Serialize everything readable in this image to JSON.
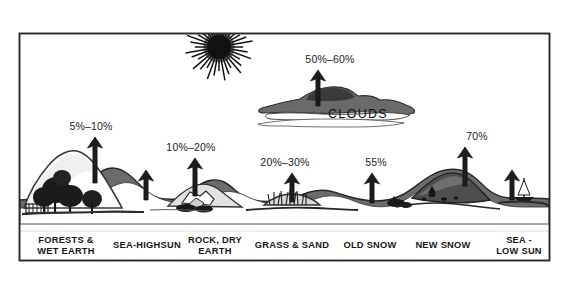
{
  "figure": {
    "type": "diagram",
    "frame": {
      "x": 19,
      "y": 33,
      "width": 531,
      "height": 228,
      "border_color": "#2a2a2a",
      "background": "#ffffff"
    },
    "ink_color": "#1f1f1f",
    "mid_gray": "#6e6e6e",
    "light_gray": "#b9b9b9"
  },
  "sun": {
    "name": "sun",
    "cx": 219,
    "cy": 47,
    "core_radius": 12,
    "ray_length": 22,
    "ray_count": 36,
    "color": "#131313"
  },
  "clouds": {
    "label": "CLOUDS",
    "label_x": 358,
    "label_y": 118,
    "percent": "50%–60%",
    "percent_x": 330,
    "percent_y": 63,
    "arrow_x": 318,
    "arrow_top": 70,
    "arrow_bottom": 106,
    "band_y": 98
  },
  "chart_data": {
    "type": "bar",
    "xlabel": "",
    "ylabel": "Percent of sunlight reflected",
    "grid": false,
    "legend": false,
    "categories": [
      "FORESTS & WET EARTH",
      "SEA-HIGHSUN",
      "ROCK, DRY EARTH",
      "GRASS & SAND",
      "OLD SNOW",
      "NEW SNOW",
      "SEA - LOW SUN",
      "CLOUDS"
    ],
    "value_labels": [
      "5%–10%",
      "",
      "10%–20%",
      "20%–30%",
      "55%",
      "70%",
      "",
      "50%–60%"
    ],
    "values": [
      7.5,
      null,
      15,
      25,
      55,
      70,
      null,
      55
    ],
    "value_ranges": [
      [
        5,
        10
      ],
      null,
      [
        10,
        20
      ],
      [
        20,
        30
      ],
      [
        55,
        55
      ],
      [
        70,
        70
      ],
      null,
      [
        50,
        60
      ]
    ],
    "units": "percent"
  },
  "surfaces": [
    {
      "id": "forests-wet-earth",
      "label_line1": "FORESTS &",
      "label_line2": "WET EARTH",
      "percent": "5%–10%",
      "percent_x": 91,
      "percent_y": 130,
      "arrow_x": 95,
      "arrow_top": 137,
      "arrow_bottom": 183,
      "label_x": 66,
      "label_y1": 243,
      "label_y2": 254
    },
    {
      "id": "sea-highsun",
      "label_line1": "SEA-HIGHSUN",
      "label_line2": "",
      "percent": "",
      "percent_x": 0,
      "percent_y": 0,
      "arrow_x": 146,
      "arrow_top": 170,
      "arrow_bottom": 200,
      "label_x": 147,
      "label_y1": 248,
      "label_y2": 0
    },
    {
      "id": "rock-dry-earth",
      "label_line1": "ROCK, DRY",
      "label_line2": "EARTH",
      "percent": "10%–20%",
      "percent_x": 191,
      "percent_y": 151,
      "arrow_x": 195,
      "arrow_top": 158,
      "arrow_bottom": 196,
      "label_x": 215,
      "label_y1": 243,
      "label_y2": 254
    },
    {
      "id": "grass-sand",
      "label_line1": "GRASS & SAND",
      "label_line2": "",
      "percent": "20%–30%",
      "percent_x": 285,
      "percent_y": 166,
      "arrow_x": 292,
      "arrow_top": 173,
      "arrow_bottom": 202,
      "label_x": 292,
      "label_y1": 248,
      "label_y2": 0
    },
    {
      "id": "old-snow",
      "label_line1": "OLD SNOW",
      "label_line2": "",
      "percent": "55%",
      "percent_x": 376,
      "percent_y": 166,
      "arrow_x": 372,
      "arrow_top": 173,
      "arrow_bottom": 203,
      "label_x": 370,
      "label_y1": 248,
      "label_y2": 0
    },
    {
      "id": "new-snow",
      "label_line1": "NEW SNOW",
      "label_line2": "",
      "percent": "70%",
      "percent_x": 477,
      "percent_y": 140,
      "arrow_x": 465,
      "arrow_top": 147,
      "arrow_bottom": 186,
      "label_x": 443,
      "label_y1": 248,
      "label_y2": 0
    },
    {
      "id": "sea-low-sun",
      "label_line1": "SEA -",
      "label_line2": "LOW SUN",
      "percent": "",
      "percent_x": 0,
      "percent_y": 0,
      "arrow_x": 512,
      "arrow_top": 170,
      "arrow_bottom": 200,
      "label_x": 519,
      "label_y1": 243,
      "label_y2": 254
    }
  ]
}
